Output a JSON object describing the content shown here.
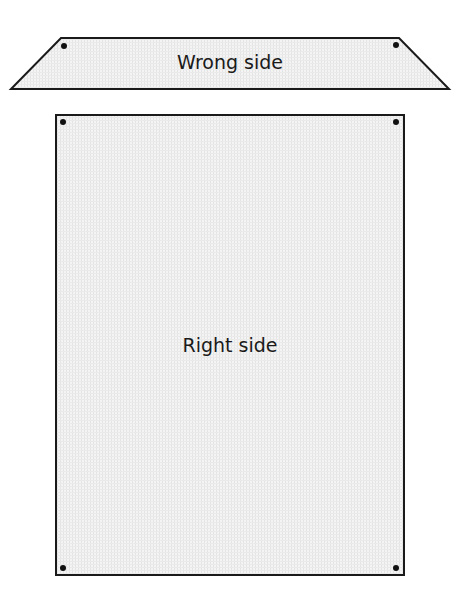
{
  "diagram": {
    "pieces": [
      {
        "id": "trapezoid-piece",
        "label": "Wrong side",
        "shape": "trapezoid",
        "points": [
          [
            61,
            38
          ],
          [
            399,
            38
          ],
          [
            449,
            89
          ],
          [
            11,
            89
          ]
        ],
        "dots": [
          [
            64,
            46
          ],
          [
            396,
            45
          ]
        ]
      },
      {
        "id": "rectangle-piece",
        "label": "Right side",
        "shape": "rectangle",
        "x": 56,
        "y": 115,
        "width": 348,
        "height": 460,
        "dots": [
          [
            63,
            122
          ],
          [
            396,
            122
          ],
          [
            63,
            568
          ],
          [
            396,
            568
          ]
        ]
      }
    ],
    "colors": {
      "fill": "#efefef",
      "stroke": "#1a1a1a",
      "text": "#1a1a1a"
    }
  }
}
